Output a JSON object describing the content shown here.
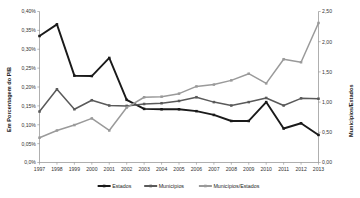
{
  "chart_data": {
    "type": "line",
    "title": "",
    "xlabel": "",
    "ylabel": "Em Porcentagem do PIB",
    "y2label": "Municípios/Estados",
    "grid": false,
    "legend_position": "bottom",
    "x": [
      1997,
      1998,
      1999,
      2000,
      2001,
      2002,
      2003,
      2004,
      2005,
      2006,
      2007,
      2008,
      2009,
      2010,
      2011,
      2012,
      2013
    ],
    "categories": [
      "1997",
      "1998",
      "1999",
      "2000",
      "2001",
      "2002",
      "2003",
      "2004",
      "2005",
      "2006",
      "2007",
      "2008",
      "2009",
      "2010",
      "2011",
      "2012",
      "2013"
    ],
    "ylim": [
      0.0,
      0.4
    ],
    "y2lim": [
      0.0,
      2.5
    ],
    "yticks": [
      0.0,
      0.05,
      0.1,
      0.15,
      0.2,
      0.25,
      0.3,
      0.35,
      0.4
    ],
    "ytick_labels": [
      "0,0%",
      "0,05%",
      "0,10%",
      "0,15%",
      "0,20%",
      "0,25%",
      "0,30%",
      "0,35%",
      "0,40%"
    ],
    "y2ticks": [
      0.0,
      0.5,
      1.0,
      1.5,
      2.0,
      2.5
    ],
    "y2tick_labels": [
      "0,00",
      "0,50",
      "1,00",
      "1,50",
      "2,00",
      "2,50"
    ],
    "series": [
      {
        "name": "Estados",
        "axis": "left",
        "color": "#1a1a1a",
        "marker": "square",
        "values": [
          0.335,
          0.366,
          0.23,
          0.229,
          0.277,
          0.166,
          0.142,
          0.141,
          0.141,
          0.136,
          0.126,
          0.11,
          0.11,
          0.16,
          0.09,
          0.104,
          0.073
        ]
      },
      {
        "name": "Municípios",
        "axis": "left",
        "color": "#5a5a5a",
        "marker": "square",
        "values": [
          0.135,
          0.194,
          0.141,
          0.165,
          0.151,
          0.15,
          0.155,
          0.157,
          0.163,
          0.173,
          0.16,
          0.151,
          0.16,
          0.171,
          0.151,
          0.17,
          0.169
        ]
      },
      {
        "name": "Municípios/Estados",
        "axis": "right",
        "color": "#9a9a9a",
        "marker": "square",
        "values": [
          0.41,
          0.53,
          0.62,
          0.73,
          0.53,
          0.91,
          1.08,
          1.09,
          1.14,
          1.26,
          1.29,
          1.36,
          1.47,
          1.31,
          1.71,
          1.66,
          2.31
        ]
      }
    ]
  },
  "legend": {
    "items": [
      {
        "label": "Estados",
        "color": "#1a1a1a"
      },
      {
        "label": "Municípios",
        "color": "#5a5a5a"
      },
      {
        "label": "Municípios/Estados",
        "color": "#9a9a9a"
      }
    ]
  },
  "axes": {
    "left_title": "Em Porcentagem do PIB",
    "right_title": "Municípios/Estados"
  }
}
